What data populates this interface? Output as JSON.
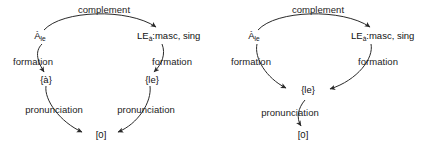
{
  "figure": {
    "background_color": "#ffffff",
    "line_color": "#2a2a2a",
    "text_color": "#1a1a1a"
  },
  "diagrams": [
    {
      "id": "left-diagram",
      "name": "a-le-divergent-pronunciation",
      "nodes": [
        {
          "id": "n1",
          "label_main": "À",
          "label_sub": "le",
          "full_text": "Àle"
        },
        {
          "id": "n2",
          "label_main": "LE",
          "label_sub": "à",
          "label_tail": ":masc, sing",
          "full_text": "LEà:masc, sing"
        },
        {
          "id": "n3",
          "label_main": "{à}",
          "label_sub": "",
          "full_text": "{à}"
        },
        {
          "id": "n4",
          "label_main": "{le}",
          "label_sub": "",
          "full_text": "{le}"
        },
        {
          "id": "n5",
          "label_main": "[0]",
          "label_sub": "",
          "full_text": "[0]"
        }
      ],
      "edges": [
        {
          "id": "e1",
          "label": "complement",
          "from": "n1",
          "to": "n2"
        },
        {
          "id": "e2",
          "label": "formation",
          "from": "n1",
          "to": "n3"
        },
        {
          "id": "e3",
          "label": "formation",
          "from": "n2",
          "to": "n4"
        },
        {
          "id": "e4",
          "label": "pronunciation",
          "from": "n3",
          "to": "n5"
        },
        {
          "id": "e5",
          "label": "pronunciation",
          "from": "n4",
          "to": "n5"
        }
      ]
    },
    {
      "id": "right-diagram",
      "name": "a-le-convergent-pronunciation",
      "nodes": [
        {
          "id": "m1",
          "label_main": "À",
          "label_sub": "le",
          "full_text": "Àle"
        },
        {
          "id": "m2",
          "label_main": "LE",
          "label_sub": "à",
          "label_tail": ":masc, sing",
          "full_text": "LEà:masc, sing"
        },
        {
          "id": "m3",
          "label_main": "{le}",
          "label_sub": "",
          "full_text": "{le}"
        },
        {
          "id": "m4",
          "label_main": "[0]",
          "label_sub": "",
          "full_text": "[0]"
        }
      ],
      "edges": [
        {
          "id": "f1",
          "label": "complement",
          "from": "m1",
          "to": "m2"
        },
        {
          "id": "f2",
          "label": "formation",
          "from": "m1",
          "to": "m3"
        },
        {
          "id": "f3",
          "label": "formation",
          "from": "m2",
          "to": "m3"
        },
        {
          "id": "f4",
          "label": "pronunciation",
          "from": "m3",
          "to": "m4"
        }
      ]
    }
  ]
}
